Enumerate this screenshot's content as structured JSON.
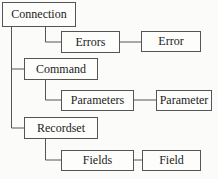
{
  "diagram": {
    "nodes": [
      {
        "id": "connection",
        "label": "Connection"
      },
      {
        "id": "errors",
        "label": "Errors"
      },
      {
        "id": "error",
        "label": "Error"
      },
      {
        "id": "command",
        "label": "Command"
      },
      {
        "id": "parameters",
        "label": "Parameters"
      },
      {
        "id": "parameter",
        "label": "Parameter"
      },
      {
        "id": "recordset",
        "label": "Recordset"
      },
      {
        "id": "fields",
        "label": "Fields"
      },
      {
        "id": "field",
        "label": "Field"
      }
    ],
    "edges": [
      [
        "connection",
        "errors"
      ],
      [
        "errors",
        "error"
      ],
      [
        "connection",
        "command"
      ],
      [
        "command",
        "parameters"
      ],
      [
        "parameters",
        "parameter"
      ],
      [
        "connection",
        "recordset"
      ],
      [
        "recordset",
        "fields"
      ],
      [
        "fields",
        "field"
      ]
    ],
    "line_color": "#555555"
  }
}
